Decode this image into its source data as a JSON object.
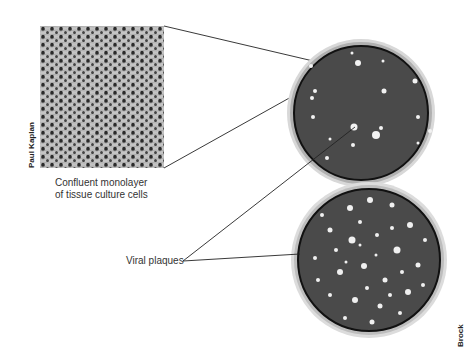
{
  "figure": {
    "panels": [
      {
        "id": "cell-monolayer-photo",
        "caption_line1": "Confluent monolayer",
        "caption_line2": "of tissue culture cells",
        "credit": "Paul Kaplan"
      },
      {
        "id": "petri-dish-few-plaques",
        "description": "Petri dish with sparse viral plaques"
      },
      {
        "id": "petri-dish-many-plaques",
        "description": "Petri dish with numerous viral plaques",
        "credit": "Brock"
      }
    ],
    "callout_label": "Viral plaques",
    "colors": {
      "plate_background": "#4a4a4a",
      "plaque": "#f2f2f2",
      "leader_line": "#222222"
    }
  }
}
